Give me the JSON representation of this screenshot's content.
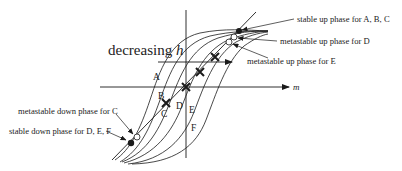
{
  "figure": {
    "axis_label_m": "m",
    "decreasing_label": "decreasing ",
    "decreasing_var": "h",
    "curve_labels": [
      "A",
      "B",
      "C",
      "D",
      "E",
      "F"
    ],
    "annotations": {
      "stable_up": "stable up phase for A, B, C",
      "metastable_up_D": "metastable up phase for D",
      "metastable_up_E": "metastable up phase for E",
      "metastable_down_C": "metastable down phase for C",
      "stable_down": "stable down phase for D, E, F"
    },
    "colors": {
      "ink": "#1a1a1a",
      "background": "#ffffff"
    }
  }
}
